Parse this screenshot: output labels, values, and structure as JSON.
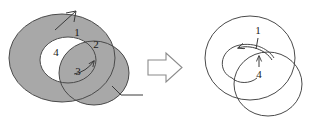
{
  "figure": {
    "background_color": "#ffffff",
    "fill_gray": "#a8a8a8",
    "stroke_color": "#4a4a4a",
    "label_color": "#1a1a1a",
    "left_diagram": {
      "name": "shaded-region-diagram",
      "description": "Gray annulus overlapped by a gray circle, with four numbered regions",
      "regions": [
        {
          "id": "region-1",
          "label": "1",
          "x": 77,
          "y": 33,
          "shading": "gray"
        },
        {
          "id": "region-2",
          "label": "2",
          "x": 96,
          "y": 45,
          "shading": "gray"
        },
        {
          "id": "region-3",
          "label": "3",
          "x": 78,
          "y": 72,
          "shading": "gray"
        },
        {
          "id": "region-4",
          "label": "4",
          "x": 56,
          "y": 53,
          "shading": "white"
        }
      ],
      "leader_lines": [
        {
          "id": "leader-line-top",
          "from_x": 55,
          "to_x": 75,
          "from_y": 28,
          "to_y": 10
        },
        {
          "id": "leader-line-bottom-right",
          "from_x": 113,
          "to_x": 143,
          "from_y": 88,
          "to_y": 95
        }
      ]
    },
    "transform_arrow": {
      "name": "implies-arrow",
      "glyph": "⇒",
      "direction": "right",
      "x": 148,
      "y": 54,
      "width": 34,
      "height": 27
    },
    "right_diagram": {
      "name": "result-diagram",
      "description": "Two overlapping outlined circles with a curved arrow pointing left and two numbered pointers",
      "regions": [
        {
          "id": "pointer-1",
          "label": "1",
          "x": 258,
          "y": 33
        },
        {
          "id": "pointer-4",
          "label": "4",
          "x": 259,
          "y": 73
        }
      ]
    }
  }
}
